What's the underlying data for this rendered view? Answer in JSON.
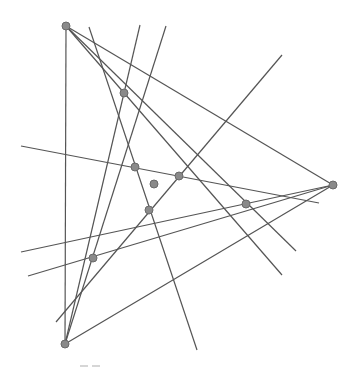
{
  "diagram": {
    "type": "geometry-construction",
    "colors": {
      "line": "#555555",
      "point_fill": "#8a8a8a",
      "point_stroke": "#6a6a6a",
      "background": "#ffffff"
    },
    "vertices": [
      {
        "id": "A",
        "x": 66,
        "y": 26
      },
      {
        "id": "B",
        "x": 333,
        "y": 185
      },
      {
        "id": "C",
        "x": 65,
        "y": 344
      }
    ],
    "points": [
      {
        "id": "P1",
        "x": 124,
        "y": 93
      },
      {
        "id": "P2",
        "x": 135,
        "y": 167
      },
      {
        "id": "P3",
        "x": 179,
        "y": 176
      },
      {
        "id": "P4",
        "x": 149,
        "y": 210
      },
      {
        "id": "P5",
        "x": 246,
        "y": 204
      },
      {
        "id": "P6",
        "x": 93,
        "y": 258
      },
      {
        "id": "G",
        "x": 154,
        "y": 184
      }
    ],
    "lines": [
      {
        "x1": 66,
        "y1": 26,
        "x2": 65,
        "y2": 344
      },
      {
        "x1": 66,
        "y1": 26,
        "x2": 333,
        "y2": 185
      },
      {
        "x1": 65,
        "y1": 344,
        "x2": 333,
        "y2": 185
      },
      {
        "x1": 66,
        "y1": 26,
        "x2": 282,
        "y2": 275
      },
      {
        "x1": 66,
        "y1": 26,
        "x2": 296,
        "y2": 251
      },
      {
        "x1": 89,
        "y1": 27,
        "x2": 197,
        "y2": 350
      },
      {
        "x1": 140,
        "y1": 25,
        "x2": 65,
        "y2": 344
      },
      {
        "x1": 166,
        "y1": 26,
        "x2": 65,
        "y2": 344
      },
      {
        "x1": 282,
        "y1": 55,
        "x2": 56,
        "y2": 322
      },
      {
        "x1": 21,
        "y1": 146,
        "x2": 319,
        "y2": 203
      },
      {
        "x1": 21,
        "y1": 252,
        "x2": 333,
        "y2": 185
      },
      {
        "x1": 28,
        "y1": 276,
        "x2": 333,
        "y2": 185
      }
    ]
  }
}
